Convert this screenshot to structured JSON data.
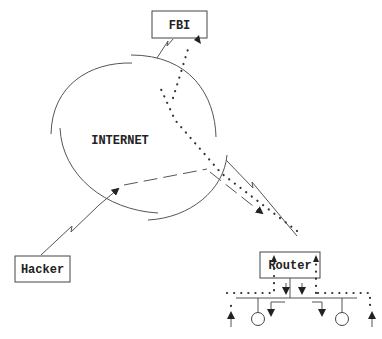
{
  "diagram": {
    "title": "",
    "nodes": {
      "fbi": {
        "label": "FBI"
      },
      "internet": {
        "label": "INTERNET"
      },
      "hacker": {
        "label": "Hacker"
      },
      "router": {
        "label": "Router"
      }
    },
    "edges": [
      {
        "from": "hacker",
        "to": "internet",
        "style": "lightning-link"
      },
      {
        "from": "fbi",
        "to": "internet",
        "style": "lightning-link"
      },
      {
        "from": "internet",
        "to": "router",
        "style": "lightning-link"
      },
      {
        "from": "hacker",
        "to": "router",
        "style": "dashed-arrow",
        "via": "internet"
      },
      {
        "from": "router",
        "to": "fbi",
        "style": "dotted-arrow",
        "via": "internet"
      },
      {
        "from": "lan",
        "to": "router",
        "style": "dotted-arrow"
      }
    ],
    "lan": {
      "hosts": 2,
      "description": "router bus with two hosts"
    }
  }
}
